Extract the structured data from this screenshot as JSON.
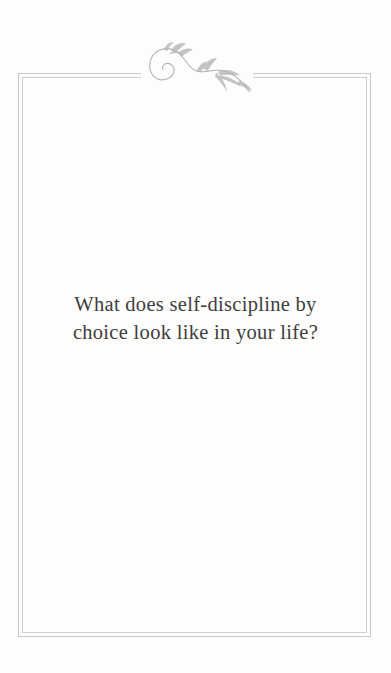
{
  "page": {
    "quote": {
      "line1": "What does self-discipline by",
      "line2": "choice look like in your life?"
    },
    "ornament": {
      "icon": "floral-flourish-icon",
      "description": "engraved scroll flourish with leaf sprays centered on top border"
    },
    "colors": {
      "background": "#fdfdfc",
      "frame_line": "#c9c9c9",
      "frame_line_inner": "#cfcfcf",
      "ornament": "#b3b3b3",
      "text": "#3e3e3e"
    }
  }
}
